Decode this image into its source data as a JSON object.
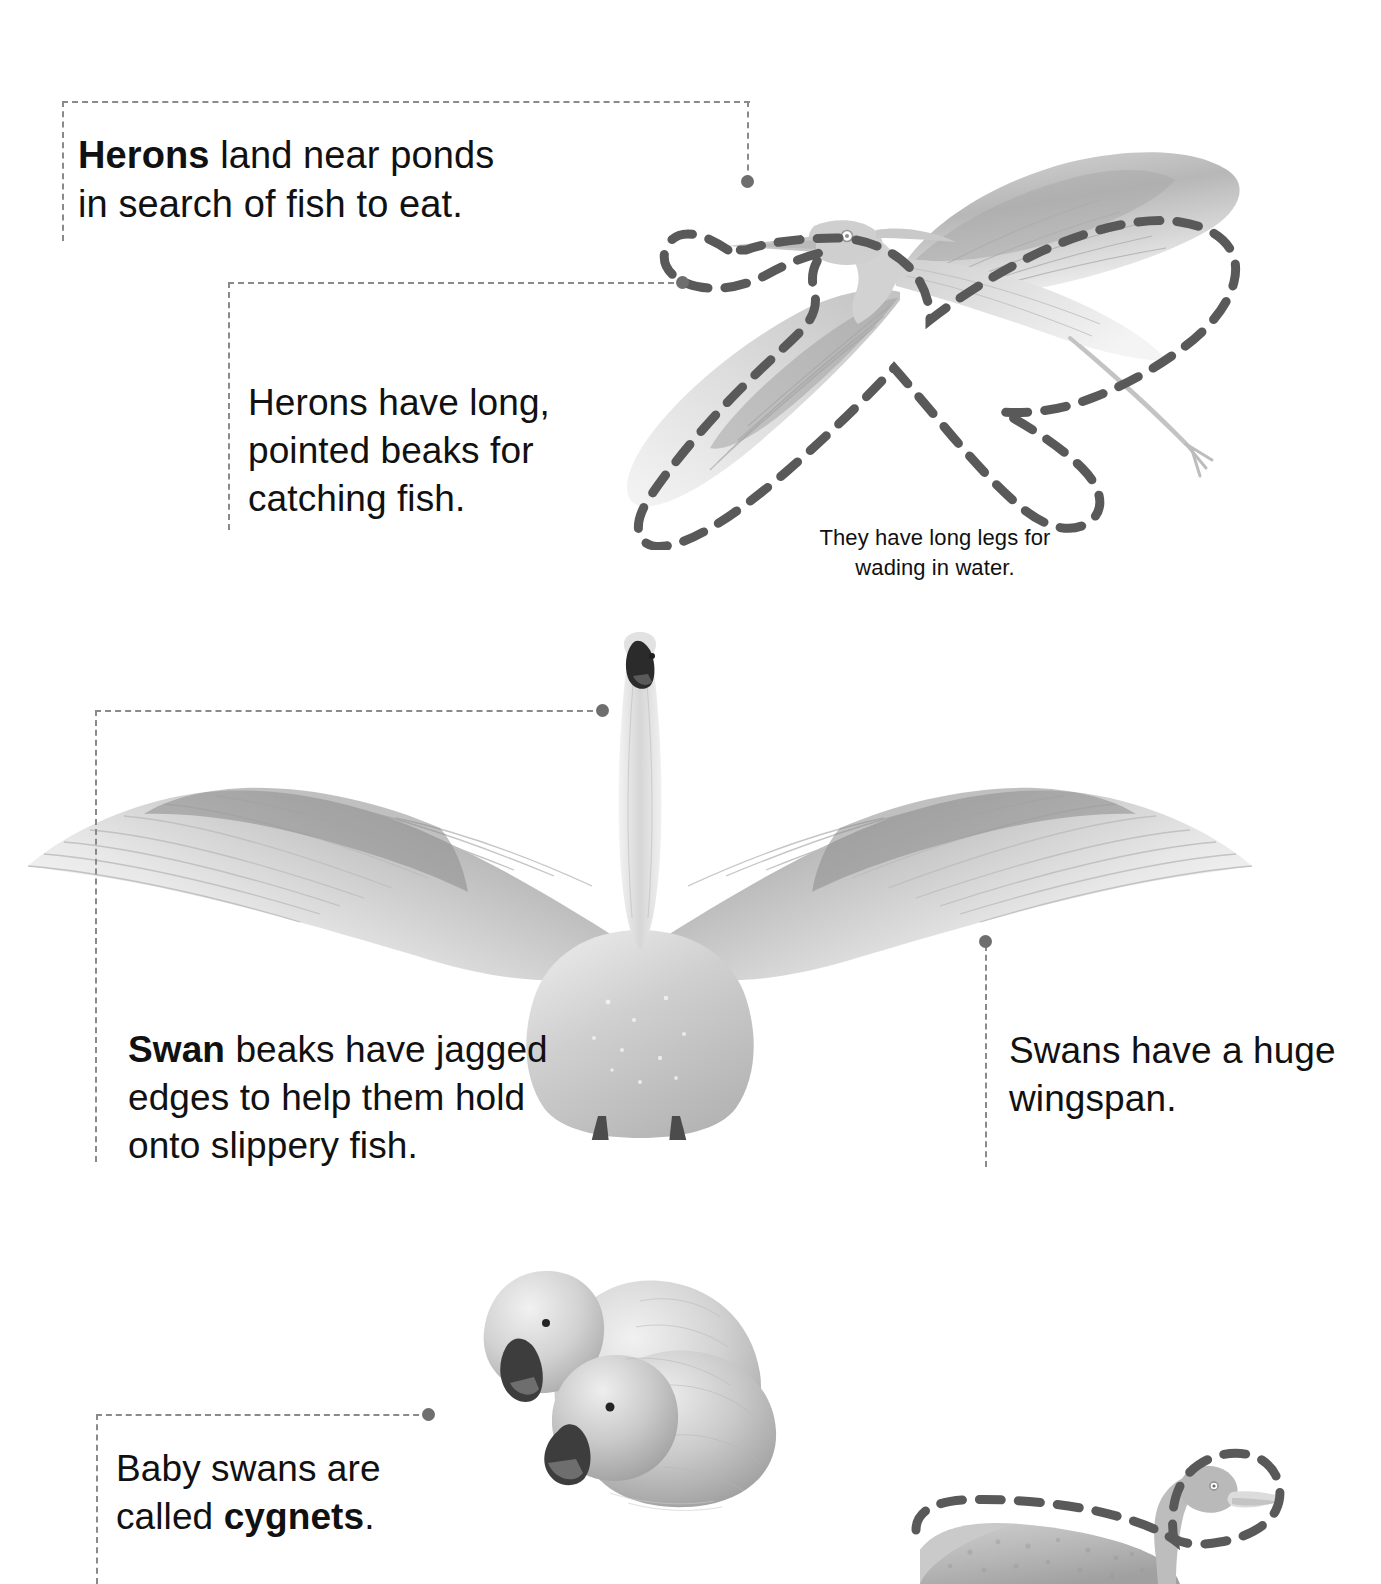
{
  "page": {
    "background_color": "#ffffff",
    "text_color": "#111111",
    "dash_color": "#8a8a8a",
    "dot_color": "#6e6e6e"
  },
  "callouts": [
    {
      "id": "heron-ponds",
      "bold_lead": "Herons",
      "text": "Herons land near ponds in search of fish to eat.",
      "rest": " land near ponds\nin search of fish to eat.",
      "target": "heron-head"
    },
    {
      "id": "heron-beaks",
      "bold_lead": "",
      "text": "Herons have long, pointed beaks for catching fish.",
      "rest": "Herons have long,\npointed beaks for\ncatching fish.",
      "target": "heron-beak"
    },
    {
      "id": "heron-legs",
      "bold_lead": "",
      "text": "They have long legs for wading in water.",
      "rest": "They have long legs for\nwading in water.",
      "target": "heron-legs"
    },
    {
      "id": "swan-beaks",
      "bold_lead": "Swan",
      "text": "Swan beaks have jagged edges to help them hold onto slippery fish.",
      "rest": " beaks have jagged\nedges to help them hold\nonto slippery fish.",
      "target": "swan-beak"
    },
    {
      "id": "swan-wingspan",
      "bold_lead": "",
      "text": "Swans have a huge wingspan.",
      "rest": "Swans have a huge\nwingspan.",
      "target": "swan-wingtip"
    },
    {
      "id": "cygnets",
      "bold_lead": "",
      "text": "Baby swans are called cygnets.",
      "lead_plain": "Baby swans are\ncalled ",
      "bold_tail": "cygnets",
      "tail_plain": ".",
      "target": "cygnets"
    }
  ],
  "illustrations": [
    {
      "id": "heron-flying",
      "name": "Grey heron in flight with wings spread",
      "has_dashed_outline": true
    },
    {
      "id": "swan-wings-spread",
      "name": "Swan facing forward with wings fully spread",
      "has_dashed_outline": false
    },
    {
      "id": "cygnets-pair",
      "name": "Two fluffy cygnets resting together",
      "has_dashed_outline": false
    },
    {
      "id": "swan-swimming",
      "name": "Swan swimming, cropped at page edge",
      "has_dashed_outline": true
    }
  ]
}
